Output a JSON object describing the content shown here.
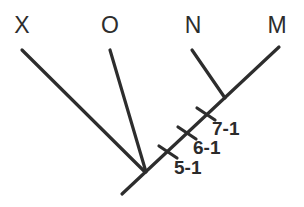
{
  "figure": {
    "kind": "cladogram",
    "background_color": "#ffffff",
    "line_color": "#2d2d2d",
    "text_color": "#2d2d2d"
  },
  "taxa": [
    {
      "name": "taxon-x",
      "label": "X",
      "x": 22,
      "y": 25
    },
    {
      "name": "taxon-o",
      "label": "O",
      "x": 110,
      "y": 25
    },
    {
      "name": "taxon-n",
      "label": "N",
      "x": 193,
      "y": 25
    },
    {
      "name": "taxon-m",
      "label": "M",
      "x": 277,
      "y": 25
    }
  ],
  "branches": [
    {
      "name": "branch-x",
      "x1": 22,
      "y1": 50,
      "x2": 145,
      "y2": 172
    },
    {
      "name": "branch-o",
      "x1": 110,
      "y1": 50,
      "x2": 146,
      "y2": 172
    },
    {
      "name": "branch-n",
      "x1": 192,
      "y1": 50,
      "x2": 225,
      "y2": 98
    },
    {
      "name": "branch-m",
      "x1": 279,
      "y1": 47,
      "x2": 122,
      "y2": 194
    }
  ],
  "nodes": [
    {
      "name": "node-root",
      "x": 145,
      "y": 172
    },
    {
      "name": "node-nm",
      "x": 225,
      "y": 98
    }
  ],
  "character_marks": [
    {
      "name": "character-5-1",
      "label": "5-1",
      "tick_x": 168,
      "tick_y": 152,
      "label_x": 174,
      "label_y": 167
    },
    {
      "name": "character-6-1",
      "label": "6-1",
      "tick_x": 187,
      "tick_y": 133,
      "label_x": 193,
      "label_y": 147
    },
    {
      "name": "character-7-1",
      "label": "7-1",
      "tick_x": 206,
      "tick_y": 114,
      "label_x": 212,
      "label_y": 128
    }
  ]
}
